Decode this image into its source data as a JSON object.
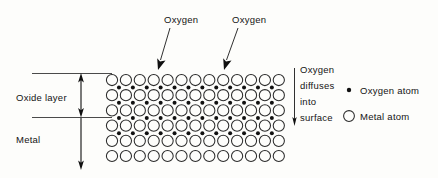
{
  "figure": {
    "type": "diagram",
    "background_color": "#fdfdfb",
    "line_color": "#1a1a1a"
  },
  "callouts": {
    "oxygen_left": "Oxygen",
    "oxygen_right": "Oxygen"
  },
  "left_labels": {
    "oxide_layer": "Oxide layer",
    "metal": "Metal"
  },
  "diffusion_note": {
    "line1": "Oxygen",
    "line2": "diffuses",
    "line3": "into",
    "line4": "surface"
  },
  "legend": {
    "items": [
      {
        "label": "Oxygen atom",
        "marker": "filled-dot",
        "color": "#111111"
      },
      {
        "label": "Metal atom",
        "marker": "open-circle",
        "color": "#2b2b2b"
      }
    ]
  },
  "lattice": {
    "columns": 13,
    "rows": 6,
    "circle_radius": 5.6,
    "col_spacing": 13.9,
    "row_spacing": 15.2,
    "origin_x": 112,
    "origin_y": 80,
    "oxygen_rows": 4,
    "oxygen_row_counts": [
      12,
      12,
      12,
      12
    ],
    "oxygen_offset_x": 6.95,
    "oxygen_offset_y": 7.6,
    "oxygen_radius": 2.0,
    "metal_only_rows": 2
  },
  "geometry": {
    "surface_line_y": 73,
    "interface_line_y": 117,
    "rule_x_start": 32,
    "rule_x_end": 112,
    "thickness_arrow_x": 81,
    "thickness_arrow_top_y": 73,
    "thickness_arrow_bottom_y": 170,
    "diffusion_arrow_x": 294,
    "diffusion_arrow_top_y": 68,
    "diffusion_arrow_bottom_y": 126
  }
}
